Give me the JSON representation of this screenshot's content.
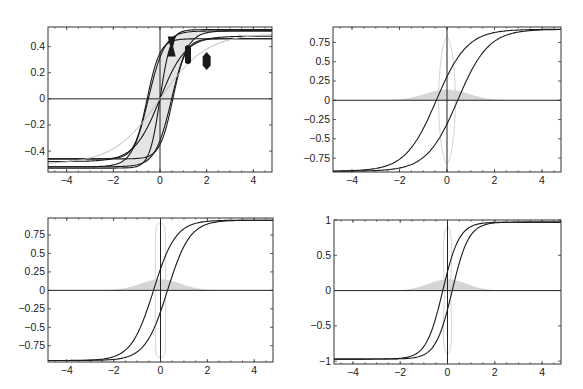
{
  "figure": {
    "width": 583,
    "height": 389,
    "layout": "2x2 grid of hysteresis-style sigmoid plots"
  },
  "chart_data": [
    {
      "id": "panel-top-left",
      "type": "line",
      "title": "",
      "xlabel": "",
      "ylabel": "",
      "frame_px": {
        "x0": 48,
        "y0": 27,
        "x1": 272,
        "y1": 172
      },
      "xlim": [
        -4.8,
        4.8
      ],
      "ylim": [
        -0.56,
        0.55
      ],
      "x_ticks": [
        -4,
        -2,
        0,
        2,
        4
      ],
      "x_tick_labels": [
        "-4",
        "-2",
        "0",
        "2",
        "4"
      ],
      "y_ticks": [
        -0.4,
        -0.2,
        0,
        0.2,
        0.4
      ],
      "y_tick_labels": [
        "-0.4",
        "-0.2",
        "0",
        "0.2",
        "0.4"
      ],
      "grid": false,
      "series": [
        {
          "name": "upper branch (outer)",
          "style": "dark",
          "kind": "tanh",
          "amp": 0.52,
          "shift": 0.5,
          "width": 0.7,
          "offset": 0.0
        },
        {
          "name": "lower branch (outer)",
          "style": "dark",
          "kind": "tanh",
          "amp": 0.52,
          "shift": -0.5,
          "width": 0.7,
          "offset": 0.0
        },
        {
          "name": "upper saturation curve",
          "style": "dark",
          "kind": "tanh",
          "amp": 0.53,
          "shift": 0.0,
          "width": 0.45,
          "offset": 0.0
        },
        {
          "name": "inner curve A",
          "style": "dark",
          "kind": "tanh",
          "amp": 0.46,
          "shift": -0.55,
          "width": 0.55,
          "offset": 0.0
        },
        {
          "name": "inner curve B",
          "style": "dark",
          "kind": "tanh",
          "amp": 0.46,
          "shift": 0.55,
          "width": 0.55,
          "offset": 0.0
        },
        {
          "name": "mid curve",
          "style": "dark",
          "kind": "tanh",
          "amp": 0.48,
          "shift": 0.0,
          "width": 1.1,
          "offset": 0.0
        },
        {
          "name": "wide gray curve",
          "style": "light",
          "kind": "tanh",
          "amp": 0.5,
          "shift": 0.0,
          "width": 2.0,
          "offset": 0.0
        }
      ],
      "band": {
        "between": [
          "lower branch (outer)",
          "upper branch (outer)"
        ],
        "color": "#e4e4e4"
      },
      "markers": [
        {
          "shape": "hourglass",
          "x": 0.5,
          "y": 0.4,
          "w_px": 8,
          "h_px": 20
        },
        {
          "shape": "bar",
          "x": 1.2,
          "y": 0.34,
          "w_px": 6,
          "h_px": 20
        },
        {
          "shape": "lozenge",
          "x": 2.0,
          "y": 0.29,
          "w_px": 8,
          "h_px": 18
        }
      ]
    },
    {
      "id": "panel-top-right",
      "type": "line",
      "title": "",
      "xlabel": "",
      "ylabel": "",
      "frame_px": {
        "x0": 333,
        "y0": 27,
        "x1": 561,
        "y1": 172
      },
      "xlim": [
        -4.8,
        4.8
      ],
      "ylim": [
        -0.93,
        0.95
      ],
      "x_ticks": [
        -4,
        -2,
        0,
        2,
        4
      ],
      "x_tick_labels": [
        "-4",
        "-2",
        "0",
        "2",
        "4"
      ],
      "y_ticks": [
        -0.75,
        -0.5,
        -0.25,
        0,
        0.25,
        0.5,
        0.75
      ],
      "y_tick_labels": [
        "-0.75",
        "-0.5",
        "-0.25",
        "0",
        "0.25",
        "0.5",
        "0.75"
      ],
      "grid": false,
      "series": [
        {
          "name": "ascending branch",
          "style": "dark",
          "kind": "tanh",
          "amp": 0.92,
          "shift": 0.45,
          "width": 1.3,
          "offset": 0.0
        },
        {
          "name": "descending branch",
          "style": "dark",
          "kind": "tanh",
          "amp": 0.92,
          "shift": -0.45,
          "width": 1.3,
          "offset": 0.0
        }
      ],
      "gaussian": {
        "amp": 0.14,
        "sigma": 0.9,
        "color": "#d6d6d6"
      },
      "loop": {
        "cx": 0.0,
        "half_width": 0.35,
        "half_height": 0.82,
        "shape": "lens",
        "color": "#d4d4d4"
      }
    },
    {
      "id": "panel-bottom-left",
      "type": "line",
      "title": "",
      "xlabel": "",
      "ylabel": "",
      "frame_px": {
        "x0": 48,
        "y0": 218,
        "x1": 273,
        "y1": 362
      },
      "xlim": [
        -4.8,
        4.8
      ],
      "ylim": [
        -0.97,
        0.98
      ],
      "x_ticks": [
        -4,
        -2,
        0,
        2,
        4
      ],
      "x_tick_labels": [
        "-4",
        "-2",
        "0",
        "2",
        "4"
      ],
      "y_ticks": [
        -0.75,
        -0.5,
        -0.25,
        0,
        0.25,
        0.5,
        0.75
      ],
      "y_tick_labels": [
        "-0.75",
        "-0.5",
        "-0.25",
        "0",
        "0.25",
        "0.5",
        "0.75"
      ],
      "grid": false,
      "series": [
        {
          "name": "ascending branch",
          "style": "dark",
          "kind": "tanh",
          "amp": 0.95,
          "shift": 0.3,
          "width": 0.95,
          "offset": 0.0
        },
        {
          "name": "descending branch",
          "style": "dark",
          "kind": "tanh",
          "amp": 0.95,
          "shift": -0.3,
          "width": 0.95,
          "offset": 0.0
        }
      ],
      "gaussian": {
        "amp": 0.15,
        "sigma": 0.85,
        "color": "#d6d6d6"
      },
      "loop": {
        "cx": 0.0,
        "half_width": 0.22,
        "half_height": 0.9,
        "shape": "capsule",
        "color": "#d4d4d4"
      }
    },
    {
      "id": "panel-bottom-right",
      "type": "line",
      "title": "",
      "xlabel": "",
      "ylabel": "",
      "frame_px": {
        "x0": 334,
        "y0": 220,
        "x1": 561,
        "y1": 364
      },
      "xlim": [
        -4.8,
        4.8
      ],
      "ylim": [
        -1.04,
        1.0
      ],
      "x_ticks": [
        -4,
        -2,
        0,
        2,
        4
      ],
      "x_tick_labels": [
        "-4",
        "-2",
        "0",
        "2",
        "4"
      ],
      "y_ticks": [
        -1,
        -0.5,
        0,
        0.5,
        1
      ],
      "y_tick_labels": [
        "-1",
        "-0.5",
        "0",
        "0.5",
        "1"
      ],
      "grid": false,
      "series": [
        {
          "name": "ascending branch",
          "style": "dark",
          "kind": "tanh",
          "amp": 0.97,
          "shift": 0.2,
          "width": 0.7,
          "offset": 0.0
        },
        {
          "name": "descending branch",
          "style": "dark",
          "kind": "tanh",
          "amp": 0.97,
          "shift": -0.2,
          "width": 0.7,
          "offset": 0.0
        }
      ],
      "gaussian": {
        "amp": 0.16,
        "sigma": 0.8,
        "color": "#d6d6d6"
      },
      "loop": {
        "cx": 0.0,
        "half_width": 0.3,
        "half_height": 0.9,
        "shape": "bowtie",
        "color": "#d4d4d4"
      }
    }
  ]
}
